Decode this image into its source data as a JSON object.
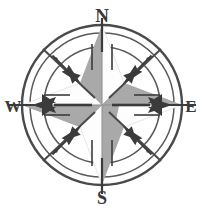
{
  "figure": {
    "name": "compass-rose",
    "background_color": "#ffffff",
    "ink_color": "#4a4a4a",
    "dark_color": "#3b3b3b",
    "star_gray": "#a9a9a9",
    "star_white": "#fdfdfd",
    "width": 204,
    "height": 210
  },
  "geometry": {
    "center_x": 102,
    "center_y": 105,
    "outer_ring_radius": 80,
    "middle_ring_radius": 72,
    "inner_ring_radius": 58,
    "dot_ring_radius": 65,
    "dot_radius": 1.6,
    "star_point_length": 80,
    "star_point_half_width": 22,
    "cardinal_arrow_length": 46,
    "intercardinal_spear_length": 40
  },
  "cardinals": [
    {
      "key": "north",
      "label": "N",
      "angle_deg": 0,
      "label_x": 102,
      "label_y": 22,
      "font_size": 19
    },
    {
      "key": "east",
      "label": "E",
      "angle_deg": 90,
      "label_x": 191,
      "label_y": 112,
      "font_size": 17
    },
    {
      "key": "south",
      "label": "S",
      "angle_deg": 180,
      "label_x": 102,
      "label_y": 204,
      "font_size": 18
    },
    {
      "key": "west",
      "label": "W",
      "angle_deg": 270,
      "label_x": 13,
      "label_y": 112,
      "font_size": 17
    }
  ],
  "intercardinals": [
    {
      "key": "northeast",
      "angle_deg": 45
    },
    {
      "key": "southeast",
      "angle_deg": 135
    },
    {
      "key": "southwest",
      "angle_deg": 225
    },
    {
      "key": "northwest",
      "angle_deg": 315
    }
  ],
  "star_points": [
    {
      "key": "north-point",
      "direction": "N",
      "fill": "gray",
      "side": "left"
    },
    {
      "key": "north-point-right",
      "direction": "N",
      "fill": "white",
      "side": "right"
    },
    {
      "key": "east-point",
      "direction": "E",
      "fill": "gray",
      "side": "upper"
    },
    {
      "key": "east-point-lower",
      "direction": "E",
      "fill": "white",
      "side": "lower"
    },
    {
      "key": "south-point",
      "direction": "S",
      "fill": "gray",
      "side": "right"
    },
    {
      "key": "south-point-left",
      "direction": "S",
      "fill": "white",
      "side": "left"
    },
    {
      "key": "west-point",
      "direction": "W",
      "fill": "gray",
      "side": "lower"
    },
    {
      "key": "west-point-upper",
      "direction": "W",
      "fill": "white",
      "side": "upper"
    }
  ],
  "ring_dots_count": 8
}
